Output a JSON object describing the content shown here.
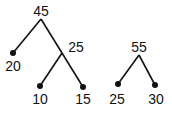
{
  "trees": [
    {
      "root": {
        "label": "45"
      },
      "left_leaf": {
        "label": "20"
      },
      "inner": {
        "label": "25"
      },
      "inner_left": {
        "label": "10"
      },
      "inner_right": {
        "label": "15"
      }
    },
    {
      "root": {
        "label": "55"
      },
      "left_leaf": {
        "label": "25"
      },
      "right_leaf": {
        "label": "30"
      }
    }
  ],
  "colors": {
    "line": "#111111",
    "dot": "#111111",
    "background": "#ffffff"
  }
}
